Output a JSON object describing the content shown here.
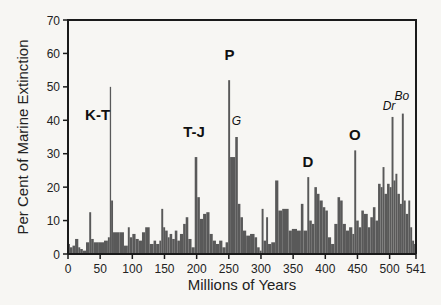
{
  "chart_data": {
    "type": "bar",
    "title": "",
    "xlabel": "Millions of Years",
    "ylabel": "Per Cent of Marine Extinction",
    "xlim": [
      0,
      541
    ],
    "ylim": [
      0,
      70
    ],
    "grid": false,
    "legend": null,
    "x_ticks": [
      0,
      50,
      100,
      150,
      200,
      250,
      300,
      350,
      400,
      450,
      500,
      541
    ],
    "y_ticks": [
      0,
      10,
      20,
      30,
      40,
      50,
      60,
      70
    ],
    "bar_color": "#595959",
    "bars": [
      {
        "x0": 0,
        "x1": 3,
        "v": 3
      },
      {
        "x0": 3,
        "x1": 7,
        "v": 2
      },
      {
        "x0": 7,
        "x1": 11,
        "v": 2.5
      },
      {
        "x0": 11,
        "x1": 16,
        "v": 4.5
      },
      {
        "x0": 16,
        "x1": 19,
        "v": 2
      },
      {
        "x0": 19,
        "x1": 23,
        "v": 1.5
      },
      {
        "x0": 23,
        "x1": 28,
        "v": 1
      },
      {
        "x0": 28,
        "x1": 33,
        "v": 3.5
      },
      {
        "x0": 33,
        "x1": 36,
        "v": 12.5
      },
      {
        "x0": 36,
        "x1": 40,
        "v": 4.5
      },
      {
        "x0": 40,
        "x1": 48,
        "v": 3.5
      },
      {
        "x0": 48,
        "x1": 56,
        "v": 3.5
      },
      {
        "x0": 56,
        "x1": 62,
        "v": 4
      },
      {
        "x0": 62,
        "x1": 65,
        "v": 5
      },
      {
        "x0": 65,
        "x1": 67,
        "v": 50
      },
      {
        "x0": 67,
        "x1": 70,
        "v": 16
      },
      {
        "x0": 70,
        "x1": 80,
        "v": 6.5
      },
      {
        "x0": 80,
        "x1": 87,
        "v": 6.5
      },
      {
        "x0": 87,
        "x1": 93,
        "v": 2.5
      },
      {
        "x0": 93,
        "x1": 96,
        "v": 8
      },
      {
        "x0": 96,
        "x1": 100,
        "v": 5
      },
      {
        "x0": 100,
        "x1": 105,
        "v": 6
      },
      {
        "x0": 105,
        "x1": 110,
        "v": 4.5
      },
      {
        "x0": 110,
        "x1": 115,
        "v": 4
      },
      {
        "x0": 115,
        "x1": 120,
        "v": 6.5
      },
      {
        "x0": 120,
        "x1": 127,
        "v": 8
      },
      {
        "x0": 127,
        "x1": 133,
        "v": 3
      },
      {
        "x0": 133,
        "x1": 137,
        "v": 4
      },
      {
        "x0": 137,
        "x1": 142,
        "v": 3
      },
      {
        "x0": 142,
        "x1": 145,
        "v": 4
      },
      {
        "x0": 145,
        "x1": 148,
        "v": 13.5
      },
      {
        "x0": 148,
        "x1": 151,
        "v": 8
      },
      {
        "x0": 151,
        "x1": 155,
        "v": 7
      },
      {
        "x0": 155,
        "x1": 158,
        "v": 5
      },
      {
        "x0": 158,
        "x1": 162,
        "v": 6
      },
      {
        "x0": 162,
        "x1": 166,
        "v": 4.5
      },
      {
        "x0": 166,
        "x1": 170,
        "v": 7
      },
      {
        "x0": 170,
        "x1": 174,
        "v": 4
      },
      {
        "x0": 174,
        "x1": 179,
        "v": 6
      },
      {
        "x0": 179,
        "x1": 183,
        "v": 9
      },
      {
        "x0": 183,
        "x1": 187,
        "v": 11
      },
      {
        "x0": 187,
        "x1": 192,
        "v": 4.5
      },
      {
        "x0": 192,
        "x1": 197,
        "v": 2
      },
      {
        "x0": 197,
        "x1": 201,
        "v": 29
      },
      {
        "x0": 201,
        "x1": 205,
        "v": 17
      },
      {
        "x0": 205,
        "x1": 210,
        "v": 10.5
      },
      {
        "x0": 210,
        "x1": 215,
        "v": 12
      },
      {
        "x0": 215,
        "x1": 220,
        "v": 12.5
      },
      {
        "x0": 220,
        "x1": 225,
        "v": 6
      },
      {
        "x0": 225,
        "x1": 230,
        "v": 4
      },
      {
        "x0": 230,
        "x1": 235,
        "v": 3
      },
      {
        "x0": 235,
        "x1": 240,
        "v": 4
      },
      {
        "x0": 240,
        "x1": 245,
        "v": 2
      },
      {
        "x0": 245,
        "x1": 249,
        "v": 3.5
      },
      {
        "x0": 249,
        "x1": 252,
        "v": 52
      },
      {
        "x0": 252,
        "x1": 260,
        "v": 29
      },
      {
        "x0": 260,
        "x1": 264,
        "v": 35
      },
      {
        "x0": 264,
        "x1": 268,
        "v": 15
      },
      {
        "x0": 268,
        "x1": 272,
        "v": 11
      },
      {
        "x0": 272,
        "x1": 277,
        "v": 7
      },
      {
        "x0": 277,
        "x1": 283,
        "v": 5.5
      },
      {
        "x0": 283,
        "x1": 290,
        "v": 6
      },
      {
        "x0": 290,
        "x1": 294,
        "v": 5
      },
      {
        "x0": 294,
        "x1": 298,
        "v": 2
      },
      {
        "x0": 298,
        "x1": 301,
        "v": 1
      },
      {
        "x0": 301,
        "x1": 304,
        "v": 13.5
      },
      {
        "x0": 304,
        "x1": 308,
        "v": 4
      },
      {
        "x0": 308,
        "x1": 311,
        "v": 11
      },
      {
        "x0": 311,
        "x1": 316,
        "v": 3
      },
      {
        "x0": 316,
        "x1": 322,
        "v": 3.5
      },
      {
        "x0": 322,
        "x1": 327,
        "v": 22
      },
      {
        "x0": 327,
        "x1": 333,
        "v": 13
      },
      {
        "x0": 333,
        "x1": 343,
        "v": 13.5
      },
      {
        "x0": 343,
        "x1": 348,
        "v": 7
      },
      {
        "x0": 348,
        "x1": 356,
        "v": 7.5
      },
      {
        "x0": 356,
        "x1": 362,
        "v": 7
      },
      {
        "x0": 362,
        "x1": 366,
        "v": 15
      },
      {
        "x0": 366,
        "x1": 372,
        "v": 7
      },
      {
        "x0": 372,
        "x1": 375,
        "v": 23
      },
      {
        "x0": 375,
        "x1": 379,
        "v": 10
      },
      {
        "x0": 379,
        "x1": 383,
        "v": 9
      },
      {
        "x0": 383,
        "x1": 387,
        "v": 20
      },
      {
        "x0": 387,
        "x1": 391,
        "v": 18
      },
      {
        "x0": 391,
        "x1": 396,
        "v": 16
      },
      {
        "x0": 396,
        "x1": 400,
        "v": 14
      },
      {
        "x0": 400,
        "x1": 404,
        "v": 13
      },
      {
        "x0": 404,
        "x1": 409,
        "v": 5
      },
      {
        "x0": 409,
        "x1": 414,
        "v": 3
      },
      {
        "x0": 414,
        "x1": 419,
        "v": 9
      },
      {
        "x0": 419,
        "x1": 423,
        "v": 17
      },
      {
        "x0": 423,
        "x1": 427,
        "v": 16
      },
      {
        "x0": 427,
        "x1": 432,
        "v": 9
      },
      {
        "x0": 432,
        "x1": 437,
        "v": 7
      },
      {
        "x0": 437,
        "x1": 442,
        "v": 8
      },
      {
        "x0": 442,
        "x1": 445,
        "v": 6
      },
      {
        "x0": 445,
        "x1": 448,
        "v": 31
      },
      {
        "x0": 448,
        "x1": 452,
        "v": 10
      },
      {
        "x0": 452,
        "x1": 456,
        "v": 8
      },
      {
        "x0": 456,
        "x1": 460,
        "v": 13
      },
      {
        "x0": 460,
        "x1": 466,
        "v": 12
      },
      {
        "x0": 466,
        "x1": 470,
        "v": 8
      },
      {
        "x0": 470,
        "x1": 474,
        "v": 11
      },
      {
        "x0": 474,
        "x1": 478,
        "v": 14
      },
      {
        "x0": 478,
        "x1": 482,
        "v": 10
      },
      {
        "x0": 482,
        "x1": 486,
        "v": 21
      },
      {
        "x0": 486,
        "x1": 489,
        "v": 20
      },
      {
        "x0": 489,
        "x1": 492,
        "v": 26
      },
      {
        "x0": 492,
        "x1": 496,
        "v": 18
      },
      {
        "x0": 496,
        "x1": 500,
        "v": 21
      },
      {
        "x0": 500,
        "x1": 503,
        "v": 20
      },
      {
        "x0": 503,
        "x1": 506,
        "v": 41
      },
      {
        "x0": 506,
        "x1": 509,
        "v": 22
      },
      {
        "x0": 509,
        "x1": 512,
        "v": 24
      },
      {
        "x0": 512,
        "x1": 516,
        "v": 18
      },
      {
        "x0": 516,
        "x1": 519,
        "v": 15
      },
      {
        "x0": 519,
        "x1": 522,
        "v": 42
      },
      {
        "x0": 522,
        "x1": 525,
        "v": 16
      },
      {
        "x0": 525,
        "x1": 529,
        "v": 12
      },
      {
        "x0": 529,
        "x1": 532,
        "v": 16
      },
      {
        "x0": 532,
        "x1": 535,
        "v": 8
      },
      {
        "x0": 535,
        "x1": 538,
        "v": 4
      },
      {
        "x0": 538,
        "x1": 541,
        "v": 3
      }
    ],
    "annotations": [
      {
        "label": "K-T",
        "x": 46,
        "y": 40,
        "style": "bold"
      },
      {
        "label": "T-J",
        "x": 196,
        "y": 35,
        "style": "bold"
      },
      {
        "label": "P",
        "x": 251,
        "y": 58,
        "style": "bold"
      },
      {
        "label": "G",
        "x": 262,
        "y": 38.5,
        "style": "italic"
      },
      {
        "label": "D",
        "x": 373,
        "y": 26,
        "style": "bold"
      },
      {
        "label": "O",
        "x": 446,
        "y": 34,
        "style": "bold"
      },
      {
        "label": "Dr",
        "x": 499,
        "y": 43,
        "style": "italic"
      },
      {
        "label": "Bo",
        "x": 519,
        "y": 46,
        "style": "italic"
      }
    ]
  }
}
